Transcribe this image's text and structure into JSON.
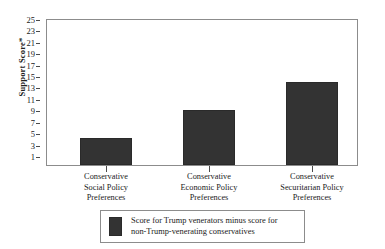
{
  "chart_data": {
    "type": "bar",
    "title": "",
    "xlabel": "",
    "ylabel": "Support Score*",
    "categories": [
      "Conservative Social Policy Preferences",
      "Conservative Economic Policy Preferences",
      "Conservative Securitarian Policy Preferences"
    ],
    "category_lines": [
      [
        "Conservative",
        "Social Policy",
        "Preferences"
      ],
      [
        "Conservative",
        "Economic Policy",
        "Preferences"
      ],
      [
        "Conservative",
        "Securitarian Policy",
        "Preferences"
      ]
    ],
    "values": [
      4.3,
      9.3,
      14.2
    ],
    "series": [
      {
        "name": "Score for Trump venerators minus score for non-Trump-venerating conservatives",
        "values": [
          4.3,
          9.3,
          14.2
        ],
        "color": "#333333"
      }
    ],
    "ylim": [
      0,
      26
    ],
    "ytick_values": [
      1,
      3,
      5,
      7,
      9,
      11,
      13,
      15,
      17,
      19,
      21,
      23,
      25
    ],
    "ytick_labels": [
      "1",
      "3",
      "5",
      "7",
      "9",
      "11",
      "13",
      "15",
      "17",
      "19",
      "21",
      "23",
      "25"
    ],
    "grid": false,
    "legend_position": "bottom",
    "bar_color": "#333333",
    "frame_color": "#8c8c8c"
  },
  "axes": {
    "y_title": "Support Score*"
  },
  "legend": {
    "lines": [
      "Score for Trump venerators minus score for",
      "non-Trump-venerating conservatives"
    ],
    "swatch_color": "#333333"
  }
}
